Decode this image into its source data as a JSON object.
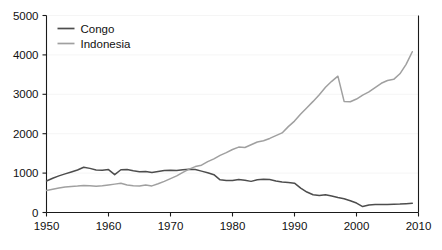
{
  "chart_data": {
    "type": "line",
    "title": "",
    "subtitle": "",
    "xlabel": "",
    "ylabel": "",
    "xlim": [
      1950,
      2010
    ],
    "ylim": [
      0,
      5000
    ],
    "grid": true,
    "legend_position": "top-left",
    "x_ticks": [
      "1950",
      "1960",
      "1970",
      "1980",
      "1990",
      "2000",
      "2010"
    ],
    "x_tick_values": [
      1950,
      1960,
      1970,
      1980,
      1990,
      2000,
      2010
    ],
    "y_ticks": [
      "0",
      "1000",
      "2000",
      "3000",
      "4000",
      "5000"
    ],
    "y_tick_values": [
      0,
      1000,
      2000,
      3000,
      4000,
      5000
    ],
    "x": [
      1950,
      1951,
      1952,
      1953,
      1954,
      1955,
      1956,
      1957,
      1958,
      1959,
      1960,
      1961,
      1962,
      1963,
      1964,
      1965,
      1966,
      1967,
      1968,
      1969,
      1970,
      1971,
      1972,
      1973,
      1974,
      1975,
      1976,
      1977,
      1978,
      1979,
      1980,
      1981,
      1982,
      1983,
      1984,
      1985,
      1986,
      1987,
      1988,
      1989,
      1990,
      1991,
      1992,
      1993,
      1994,
      1995,
      1996,
      1997,
      1998,
      1999,
      2000,
      2001,
      2002,
      2003,
      2004,
      2005,
      2006,
      2007,
      2008,
      2009
    ],
    "series": [
      {
        "name": "Congo",
        "color": "#4d4d4d",
        "values": [
          800,
          870,
          930,
          980,
          1030,
          1080,
          1150,
          1120,
          1080,
          1075,
          1090,
          960,
          1085,
          1090,
          1060,
          1035,
          1040,
          1015,
          1040,
          1065,
          1075,
          1065,
          1085,
          1100,
          1090,
          1050,
          1010,
          960,
          830,
          815,
          810,
          840,
          820,
          790,
          830,
          845,
          835,
          800,
          775,
          760,
          745,
          620,
          520,
          450,
          430,
          450,
          420,
          380,
          350,
          300,
          240,
          150,
          190,
          200,
          200,
          205,
          210,
          215,
          225,
          235
        ]
      },
      {
        "name": "Indonesia",
        "color": "#a0a0a0",
        "values": [
          560,
          590,
          620,
          645,
          660,
          670,
          685,
          680,
          665,
          680,
          700,
          720,
          740,
          700,
          680,
          670,
          700,
          675,
          730,
          790,
          860,
          930,
          1020,
          1100,
          1165,
          1200,
          1290,
          1360,
          1450,
          1520,
          1600,
          1660,
          1650,
          1720,
          1790,
          1820,
          1880,
          1950,
          2020,
          2180,
          2320,
          2500,
          2660,
          2820,
          2990,
          3180,
          3330,
          3460,
          2820,
          2810,
          2880,
          2980,
          3060,
          3170,
          3280,
          3350,
          3380,
          3520,
          3760,
          4080
        ]
      }
    ]
  },
  "legend": {
    "entries": [
      {
        "label": "Congo"
      },
      {
        "label": "Indonesia"
      }
    ]
  },
  "axes": {
    "x_tick_labels": [
      "1950",
      "1960",
      "1970",
      "1980",
      "1990",
      "2000",
      "2010"
    ],
    "y_tick_labels": [
      "0",
      "1000",
      "2000",
      "3000",
      "4000",
      "5000"
    ]
  }
}
